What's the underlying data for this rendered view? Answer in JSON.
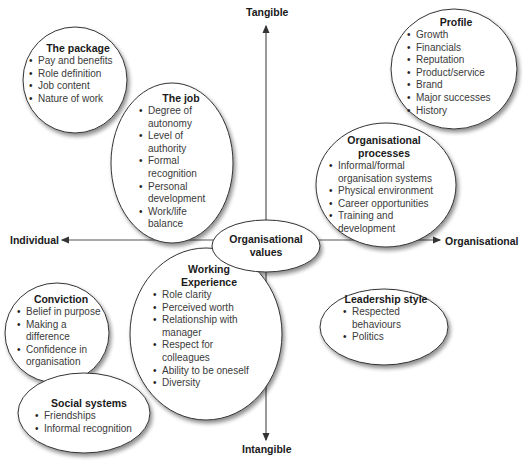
{
  "axes": {
    "top": "Tangible",
    "bottom": "Intangible",
    "left": "Individual",
    "right": "Organisational"
  },
  "center": {
    "line1": "Organisational",
    "line2": "values"
  },
  "bubbles": {
    "package": {
      "title": "The package",
      "items": [
        "Pay and benefits",
        "Role definition",
        "Job content",
        "Nature of work"
      ]
    },
    "job": {
      "title": "The job",
      "items": [
        "Degree of autonomy",
        "Level of authority",
        "Formal recognition",
        "Personal development",
        "Work/life balance"
      ]
    },
    "profile": {
      "title": "Profile",
      "items": [
        "Growth",
        "Financials",
        "Reputation",
        "Product/service",
        "Brand",
        "Major successes",
        "History"
      ]
    },
    "processes": {
      "title_line1": "Organisational",
      "title_line2": "processes",
      "items": [
        "Informal/formal organisation systems",
        "Physical environment",
        "Career opportunities",
        "Training and development"
      ]
    },
    "conviction": {
      "title": "Conviction",
      "items": [
        "Belief in purpose",
        "Making a difference",
        "Confidence in organisation"
      ]
    },
    "working": {
      "title_line1": "Working",
      "title_line2": "Experience",
      "items": [
        "Role clarity",
        "Perceived worth",
        "Relationship with manager",
        "Respect for colleagues",
        "Ability to be oneself",
        "Diversity"
      ]
    },
    "leadership": {
      "title": "Leadership style",
      "items": [
        "Respected behaviours",
        "Politics"
      ]
    },
    "social": {
      "title": "Social systems",
      "items": [
        "Friendships",
        "Informal recognition"
      ]
    }
  },
  "colors": {
    "stroke": "#333333",
    "fill": "#ffffff",
    "shadow": "#b8b8b8"
  }
}
